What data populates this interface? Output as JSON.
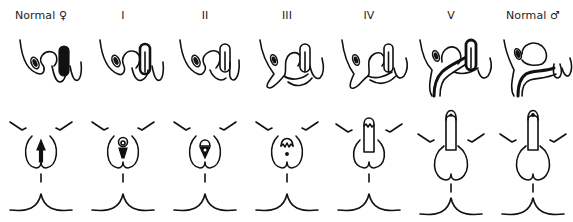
{
  "figure": {
    "columns": [
      {
        "label": "Normal ♀",
        "stage": "normal-female"
      },
      {
        "label": "I",
        "stage": "1"
      },
      {
        "label": "II",
        "stage": "2"
      },
      {
        "label": "III",
        "stage": "3"
      },
      {
        "label": "IV",
        "stage": "4"
      },
      {
        "label": "V",
        "stage": "5"
      },
      {
        "label": "Normal ♂",
        "stage": "normal-male"
      }
    ],
    "rows": [
      {
        "name": "sagittal-view"
      },
      {
        "name": "external-perineal-view"
      }
    ],
    "colors": {
      "line": "#111111",
      "background": "#ffffff",
      "label": "#222222"
    }
  }
}
